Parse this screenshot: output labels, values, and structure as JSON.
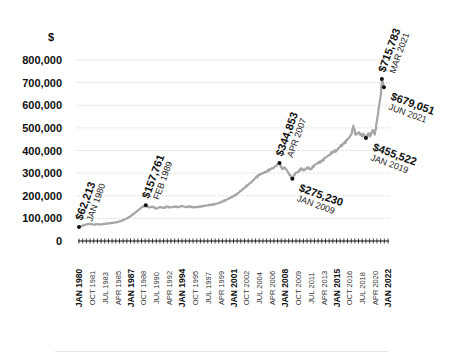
{
  "chart_data": {
    "type": "line",
    "title": "",
    "ylabel": "$",
    "xlabel": "",
    "ylim": [
      0,
      800000
    ],
    "yticks": [
      0,
      100000,
      200000,
      300000,
      400000,
      500000,
      600000,
      700000,
      800000
    ],
    "ytick_labels": [
      "0",
      "100,000",
      "200,000",
      "300,000",
      "400,000",
      "500,000",
      "600,000",
      "700,000",
      "800,000"
    ],
    "grid": true,
    "legend": null,
    "xtick_labels": [
      {
        "label": "JAN 1980",
        "major": true
      },
      {
        "label": "OCT 1981",
        "major": false
      },
      {
        "label": "JUL 1983",
        "major": false
      },
      {
        "label": "APR 1985",
        "major": false
      },
      {
        "label": "JAN 1987",
        "major": true
      },
      {
        "label": "OCT 1988",
        "major": false
      },
      {
        "label": "JUL 1990",
        "major": false
      },
      {
        "label": "APR 1992",
        "major": false
      },
      {
        "label": "JAN 1994",
        "major": true
      },
      {
        "label": "OCT 1995",
        "major": false
      },
      {
        "label": "JUL 1997",
        "major": false
      },
      {
        "label": "APR 1999",
        "major": false
      },
      {
        "label": "JAN 2001",
        "major": true
      },
      {
        "label": "OCT 2002",
        "major": false
      },
      {
        "label": "JUL 2004",
        "major": false
      },
      {
        "label": "APR 2006",
        "major": false
      },
      {
        "label": "JAN 2008",
        "major": true
      },
      {
        "label": "OCT 2009",
        "major": false
      },
      {
        "label": "JUL 2011",
        "major": false
      },
      {
        "label": "APR 2013",
        "major": false
      },
      {
        "label": "JAN 2015",
        "major": true
      },
      {
        "label": "OCT 2016",
        "major": false
      },
      {
        "label": "JUL 2018",
        "major": false
      },
      {
        "label": "APR 2020",
        "major": false
      },
      {
        "label": "JAN 2022",
        "major": true
      }
    ],
    "series": [
      {
        "name": "Average price",
        "color": "#a6a6a6",
        "points": [
          [
            1980.0,
            62213
          ],
          [
            1980.5,
            68000
          ],
          [
            1981.0,
            74000
          ],
          [
            1981.5,
            76000
          ],
          [
            1982.0,
            72000
          ],
          [
            1982.5,
            74000
          ],
          [
            1983.0,
            73000
          ],
          [
            1983.5,
            76000
          ],
          [
            1984.0,
            78000
          ],
          [
            1984.5,
            80000
          ],
          [
            1985.0,
            82000
          ],
          [
            1985.5,
            86000
          ],
          [
            1986.0,
            92000
          ],
          [
            1986.5,
            100000
          ],
          [
            1987.0,
            110000
          ],
          [
            1987.5,
            122000
          ],
          [
            1988.0,
            135000
          ],
          [
            1988.5,
            148000
          ],
          [
            1989.08,
            157761
          ],
          [
            1989.5,
            148000
          ],
          [
            1990.0,
            152000
          ],
          [
            1990.5,
            143000
          ],
          [
            1991.0,
            150000
          ],
          [
            1991.5,
            146000
          ],
          [
            1992.0,
            152000
          ],
          [
            1992.5,
            148000
          ],
          [
            1993.0,
            153000
          ],
          [
            1993.5,
            150000
          ],
          [
            1994.0,
            155000
          ],
          [
            1994.5,
            150000
          ],
          [
            1995.0,
            152000
          ],
          [
            1995.5,
            149000
          ],
          [
            1996.0,
            150000
          ],
          [
            1996.5,
            153000
          ],
          [
            1997.0,
            155000
          ],
          [
            1997.5,
            158000
          ],
          [
            1998.0,
            160000
          ],
          [
            1998.5,
            163000
          ],
          [
            1999.0,
            168000
          ],
          [
            1999.5,
            175000
          ],
          [
            2000.0,
            182000
          ],
          [
            2000.5,
            190000
          ],
          [
            2001.0,
            198000
          ],
          [
            2001.5,
            208000
          ],
          [
            2002.0,
            222000
          ],
          [
            2002.5,
            236000
          ],
          [
            2003.0,
            250000
          ],
          [
            2003.5,
            262000
          ],
          [
            2004.0,
            278000
          ],
          [
            2004.5,
            292000
          ],
          [
            2005.0,
            300000
          ],
          [
            2005.5,
            308000
          ],
          [
            2006.0,
            318000
          ],
          [
            2006.5,
            325000
          ],
          [
            2007.25,
            344853
          ],
          [
            2007.6,
            318000
          ],
          [
            2008.0,
            325000
          ],
          [
            2008.5,
            300000
          ],
          [
            2009.0,
            275230
          ],
          [
            2009.4,
            300000
          ],
          [
            2009.8,
            305000
          ],
          [
            2010.2,
            320000
          ],
          [
            2010.6,
            312000
          ],
          [
            2011.0,
            325000
          ],
          [
            2011.5,
            318000
          ],
          [
            2012.0,
            335000
          ],
          [
            2012.5,
            345000
          ],
          [
            2013.0,
            352000
          ],
          [
            2013.5,
            368000
          ],
          [
            2014.0,
            380000
          ],
          [
            2014.5,
            395000
          ],
          [
            2015.0,
            400000
          ],
          [
            2015.5,
            418000
          ],
          [
            2016.0,
            430000
          ],
          [
            2016.5,
            448000
          ],
          [
            2017.0,
            470000
          ],
          [
            2017.3,
            510000
          ],
          [
            2017.6,
            470000
          ],
          [
            2018.0,
            480000
          ],
          [
            2018.4,
            465000
          ],
          [
            2018.7,
            470000
          ],
          [
            2019.0,
            455522
          ],
          [
            2019.3,
            475000
          ],
          [
            2019.6,
            465000
          ],
          [
            2019.9,
            490000
          ],
          [
            2020.2,
            470000
          ],
          [
            2020.5,
            530000
          ],
          [
            2020.8,
            600000
          ],
          [
            2021.0,
            640000
          ],
          [
            2021.17,
            715783
          ],
          [
            2021.45,
            679051
          ]
        ]
      }
    ],
    "annotations": [
      {
        "value": "$62,213",
        "date": "JAN 1980",
        "x": 1980.0,
        "y": 62213,
        "placement": "above"
      },
      {
        "value": "$157,761",
        "date": "FEB 1989",
        "x": 1989.08,
        "y": 157761,
        "placement": "above"
      },
      {
        "value": "$344,853",
        "date": "APR 2007",
        "x": 2007.25,
        "y": 344853,
        "placement": "above"
      },
      {
        "value": "$275,230",
        "date": "JAN 2009",
        "x": 2009.0,
        "y": 275230,
        "placement": "below"
      },
      {
        "value": "$715,783",
        "date": "MAR 2021",
        "x": 2021.17,
        "y": 715783,
        "placement": "above"
      },
      {
        "value": "$679,051",
        "date": "JUN 2021",
        "x": 2021.45,
        "y": 679051,
        "placement": "below"
      },
      {
        "value": "$455,522",
        "date": "JAN 2019",
        "x": 2019.0,
        "y": 455522,
        "placement": "below"
      }
    ]
  }
}
